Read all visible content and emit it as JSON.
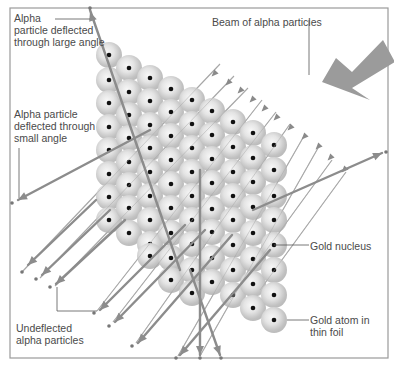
{
  "figure": {
    "type": "rutherford-gold-foil-scattering",
    "frame": {
      "x": 10,
      "y": 8,
      "width": 378,
      "height": 350
    }
  },
  "labels": {
    "large_angle": "Alpha\nparticle deflected\nthrough large angle",
    "small_angle": "Alpha particle\ndeflected through\nsmall angle",
    "beam": "Beam of alpha particles",
    "gold_nucleus": "Gold nucleus",
    "gold_atom": "Gold atom in\nthin foil",
    "undeflected": "Undeflected\nalpha particles"
  },
  "colors": {
    "frame": "#9a9a9a",
    "beam_line": "#a8a8a8",
    "beam_head": "#8a8a8a",
    "deflected_path": "#8c8c8c",
    "big_arrow": "#9b9b9b",
    "atom_light": "#f2f2f2",
    "atom_dark": "#b4b4b4",
    "nucleus": "#111111",
    "leader": "#555555",
    "text": "#4a4a4a"
  },
  "atoms": {
    "radius": 13,
    "columns": [
      {
        "x": 109,
        "ys": [
          55,
          80,
          103,
          127,
          150,
          174,
          197,
          220
        ]
      },
      {
        "x": 129,
        "ys": [
          68,
          92,
          115,
          138,
          162,
          185,
          208,
          233
        ]
      },
      {
        "x": 150,
        "ys": [
          78,
          101,
          125,
          148,
          172,
          196,
          220,
          244,
          256
        ]
      },
      {
        "x": 171,
        "ys": [
          89,
          112,
          136,
          160,
          184,
          208,
          233,
          258,
          280
        ]
      },
      {
        "x": 192,
        "ys": [
          100,
          124,
          148,
          172,
          196,
          220,
          244,
          270,
          293
        ]
      },
      {
        "x": 212,
        "ys": [
          111,
          135,
          159,
          183,
          209,
          232,
          258,
          282
        ]
      },
      {
        "x": 233,
        "ys": [
          122,
          147,
          172,
          196,
          220,
          245,
          270,
          295
        ]
      },
      {
        "x": 253,
        "ys": [
          133,
          158,
          182,
          207,
          233,
          259,
          284,
          308
        ]
      },
      {
        "x": 274,
        "ys": [
          145,
          170,
          196,
          220,
          245,
          270,
          295,
          320
        ]
      }
    ]
  },
  "beam_lines": [
    {
      "x1": 220,
      "y1": 64,
      "x2": 22,
      "y2": 272
    },
    {
      "x1": 234,
      "y1": 76,
      "x2": 40,
      "y2": 278
    },
    {
      "x1": 248,
      "y1": 88,
      "x2": 55,
      "y2": 286
    },
    {
      "x1": 262,
      "y1": 100,
      "x2": 97,
      "y2": 311
    },
    {
      "x1": 276,
      "y1": 112,
      "x2": 113,
      "y2": 322
    },
    {
      "x1": 290,
      "y1": 124,
      "x2": 136,
      "y2": 343
    },
    {
      "x1": 304,
      "y1": 136,
      "x2": 178,
      "y2": 356
    },
    {
      "x1": 318,
      "y1": 148,
      "x2": 200,
      "y2": 356
    },
    {
      "x1": 332,
      "y1": 160,
      "x2": 230,
      "y2": 300
    },
    {
      "x1": 346,
      "y1": 172,
      "x2": 260,
      "y2": 290
    }
  ],
  "beam_heads": [
    [
      214,
      74
    ],
    [
      228,
      83
    ],
    [
      240,
      91
    ],
    [
      252,
      100
    ],
    [
      264,
      109
    ],
    [
      276,
      118
    ],
    [
      290,
      128
    ],
    [
      304,
      137
    ],
    [
      318,
      147
    ],
    [
      330,
      158
    ],
    [
      344,
      170
    ]
  ],
  "deflected_paths": [
    {
      "name": "large-angle",
      "points": [
        [
          180,
          270
        ],
        [
          90,
          10
        ]
      ],
      "head": [
        90,
        12
      ],
      "end_dot": [
        90,
        8
      ]
    },
    {
      "name": "small-angle",
      "points": [
        [
          150,
          130
        ],
        [
          18,
          200
        ]
      ],
      "head": [
        18,
        200
      ],
      "end_dot": [
        12,
        203
      ]
    },
    {
      "name": "right-deflection",
      "points": [
        [
          253,
          210
        ],
        [
          382,
          153
        ]
      ],
      "head": [
        382,
        153
      ],
      "end_dot": [
        386,
        152
      ]
    },
    {
      "name": "down-straight",
      "points": [
        [
          200,
          170
        ],
        [
          200,
          355
        ]
      ],
      "head": [
        200,
        355
      ],
      "end_dot": [
        200,
        358
      ]
    },
    {
      "name": "down-slant",
      "points": [
        [
          190,
          270
        ],
        [
          220,
          355
        ]
      ],
      "head": [
        220,
        355
      ],
      "end_dot": [
        221,
        358
      ]
    },
    {
      "name": "lower-left-1",
      "points": [
        [
          96,
          200
        ],
        [
          28,
          265
        ]
      ],
      "head": [
        28,
        265
      ],
      "end_dot": [
        22,
        272
      ]
    },
    {
      "name": "lower-left-2",
      "points": [
        [
          110,
          210
        ],
        [
          42,
          275
        ]
      ],
      "head": [
        42,
        275
      ],
      "end_dot": [
        36,
        279
      ]
    },
    {
      "name": "lower-left-3",
      "points": [
        [
          125,
          220
        ],
        [
          56,
          284
        ]
      ],
      "head": [
        56,
        284
      ],
      "end_dot": [
        50,
        287
      ]
    },
    {
      "name": "lower-left-4",
      "points": [
        [
          185,
          225
        ],
        [
          100,
          310
        ]
      ],
      "head": [
        100,
        310
      ],
      "end_dot": [
        94,
        313
      ]
    },
    {
      "name": "lower-left-5",
      "points": [
        [
          205,
          230
        ],
        [
          115,
          322
        ]
      ],
      "head": [
        115,
        322
      ],
      "end_dot": [
        109,
        326
      ]
    },
    {
      "name": "lower-left-6",
      "points": [
        [
          232,
          235
        ],
        [
          138,
          343
        ]
      ],
      "head": [
        138,
        343
      ],
      "end_dot": [
        132,
        346
      ]
    },
    {
      "name": "lower-left-7",
      "points": [
        [
          270,
          250
        ],
        [
          180,
          355
        ]
      ],
      "head": [
        180,
        355
      ],
      "end_dot": [
        176,
        358
      ]
    }
  ],
  "big_arrow": {
    "points": [
      [
        352,
        60
      ],
      [
        383,
        40
      ],
      [
        370,
        95
      ],
      [
        325,
        82
      ]
    ]
  },
  "leaders": [
    {
      "name": "large-angle-leader",
      "points": [
        [
          55,
          19
        ],
        [
          90,
          19
        ]
      ]
    },
    {
      "name": "beam-leader",
      "points": [
        [
          309,
          20
        ],
        [
          309,
          75
        ]
      ]
    },
    {
      "name": "small-angle-leader",
      "points": [
        [
          19,
          148
        ],
        [
          19,
          198
        ]
      ]
    },
    {
      "name": "gold-nucleus-leader",
      "points": [
        [
          274,
          245
        ],
        [
          309,
          245
        ]
      ]
    },
    {
      "name": "gold-atom-leader",
      "points": [
        [
          287,
          320
        ],
        [
          309,
          320
        ]
      ]
    },
    {
      "name": "undeflected-bracket",
      "points": [
        [
          57,
          287
        ],
        [
          57,
          311
        ],
        [
          97,
          311
        ]
      ]
    }
  ],
  "label_positions": {
    "large_angle": {
      "x": 14,
      "y": 12
    },
    "small_angle": {
      "x": 14,
      "y": 108
    },
    "beam": {
      "x": 212,
      "y": 16
    },
    "gold_nucleus": {
      "x": 310,
      "y": 240
    },
    "gold_atom": {
      "x": 310,
      "y": 314
    },
    "undeflected": {
      "x": 16,
      "y": 322
    }
  }
}
